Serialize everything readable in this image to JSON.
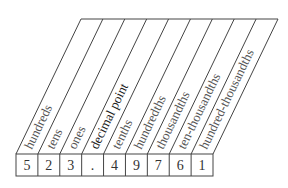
{
  "diagram": {
    "columns": [
      {
        "label": "hundreds",
        "digit": "5"
      },
      {
        "label": "tens",
        "digit": "2"
      },
      {
        "label": "ones",
        "digit": "3"
      },
      {
        "label": "decimal point",
        "digit": "."
      },
      {
        "label": "tenths",
        "digit": "4"
      },
      {
        "label": "hundredths",
        "digit": "9"
      },
      {
        "label": "thousandths",
        "digit": "7"
      },
      {
        "label": "ten-thousandths",
        "digit": "6"
      },
      {
        "label": "hundred-thousandths",
        "digit": "1"
      }
    ],
    "number": "523.49761",
    "colors": {
      "line": "#444444",
      "label": "#555555",
      "digit": "#333333"
    }
  }
}
